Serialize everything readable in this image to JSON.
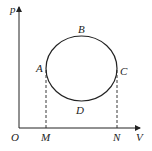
{
  "diagram": {
    "type": "p-V diagram",
    "axes": {
      "y_label": "p",
      "x_label": "V",
      "origin_label": "O"
    },
    "points": {
      "A": "A",
      "B": "B",
      "C": "C",
      "D": "D"
    },
    "x_markers": {
      "M": "M",
      "N": "N"
    },
    "cycle": "closed elliptical cycle A-B-C-D",
    "colors": {
      "line": "#222222",
      "background": "#ffffff"
    }
  }
}
